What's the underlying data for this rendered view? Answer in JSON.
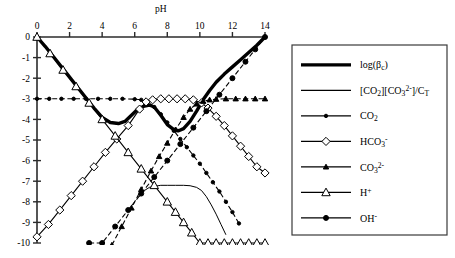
{
  "chart_data": {
    "type": "line",
    "title": "",
    "xlabel": "pH",
    "ylabel": "",
    "xlim": [
      0,
      14
    ],
    "ylim": [
      -10,
      0
    ],
    "xticks": [
      0,
      2,
      4,
      6,
      8,
      10,
      12,
      14
    ],
    "yticks": [
      0,
      -1,
      -2,
      -3,
      -4,
      -5,
      -6,
      -7,
      -8,
      -9,
      -10
    ],
    "xtick_labels": [
      "0",
      "2",
      "4",
      "6",
      "8",
      "10",
      "12",
      "14"
    ],
    "ytick_labels": [
      "0",
      "-1",
      "-2",
      "-3",
      "-4",
      "-5",
      "-6",
      "-7",
      "-8",
      "-9",
      "-10"
    ],
    "grid": false,
    "legend_position": "right",
    "series": [
      {
        "name": "log(βc)",
        "marker": "none",
        "linestyle": "solid-thick",
        "x": [
          0,
          0.5,
          1,
          1.5,
          2,
          2.5,
          3,
          3.5,
          4,
          4.5,
          5,
          5.4,
          5.8,
          6.2,
          6.6,
          6.9,
          7.2,
          7.6,
          8,
          8.4,
          8.7,
          9,
          9.4,
          9.8,
          10.2,
          10.6,
          11,
          11.5,
          12,
          12.5,
          13,
          13.5,
          14
        ],
        "y": [
          0,
          -0.45,
          -0.95,
          -1.45,
          -1.95,
          -2.45,
          -2.95,
          -3.45,
          -3.9,
          -4.15,
          -4.2,
          -4.1,
          -3.8,
          -3.5,
          -3.35,
          -3.3,
          -3.4,
          -3.8,
          -4.25,
          -4.5,
          -4.55,
          -4.45,
          -4.1,
          -3.6,
          -3.05,
          -2.6,
          -2.2,
          -1.8,
          -1.45,
          -1.1,
          -0.75,
          -0.4,
          0
        ]
      },
      {
        "name": "[CO2][CO3 2-]/CT",
        "marker": "none",
        "linestyle": "solid-thin",
        "x": [
          6.3,
          6.6,
          6.9,
          7.2,
          7.6,
          8,
          8.5,
          9,
          9.4,
          9.8,
          10.1,
          10.4,
          10.7,
          11,
          11.3,
          11.6
        ],
        "y": [
          -7.75,
          -7.45,
          -7.3,
          -7.25,
          -7.2,
          -7.2,
          -7.2,
          -7.2,
          -7.22,
          -7.3,
          -7.45,
          -7.75,
          -8.15,
          -8.6,
          -9.1,
          -9.6
        ]
      },
      {
        "name": "CO2",
        "marker": "small-filled-circle",
        "linestyle": "dash-dot",
        "x": [
          0,
          0.75,
          1.5,
          2.25,
          3,
          3.75,
          4.5,
          5.25,
          6,
          6.4,
          6.8,
          7.2,
          7.6,
          8,
          8.4,
          8.8,
          9.2,
          9.6,
          10,
          10.4,
          10.8,
          11.2,
          11.6,
          12,
          12.4
        ],
        "y": [
          -3.0,
          -3.0,
          -3.0,
          -3.0,
          -3.0,
          -3.0,
          -3.0,
          -3.0,
          -3.02,
          -3.05,
          -3.15,
          -3.4,
          -3.75,
          -4.15,
          -4.55,
          -4.95,
          -5.35,
          -5.75,
          -6.15,
          -6.6,
          -7.05,
          -7.5,
          -8.0,
          -8.5,
          -9.05
        ]
      },
      {
        "name": "HCO3-",
        "marker": "open-diamond",
        "linestyle": "solid",
        "x": [
          0,
          0.7,
          1.4,
          2.1,
          2.8,
          3.5,
          4.2,
          4.9,
          5.6,
          6.3,
          6.7,
          7.1,
          7.6,
          8.1,
          8.6,
          9.1,
          9.6,
          10.1,
          10.5,
          11,
          11.5,
          12,
          12.5,
          13,
          13.5,
          14
        ],
        "y": [
          -9.7,
          -9.1,
          -8.4,
          -7.7,
          -7.0,
          -6.3,
          -5.6,
          -4.95,
          -4.3,
          -3.5,
          -3.15,
          -3.05,
          -3.0,
          -3.0,
          -3.0,
          -3.0,
          -3.05,
          -3.2,
          -3.45,
          -3.85,
          -4.3,
          -4.8,
          -5.3,
          -5.8,
          -6.3,
          -6.6
        ]
      },
      {
        "name": "CO3 2-",
        "marker": "small-filled-triangle",
        "linestyle": "dash-dot",
        "x": [
          4.6,
          5.2,
          5.8,
          6.4,
          7,
          7.5,
          8,
          8.5,
          9,
          9.4,
          9.8,
          10.2,
          10.6,
          11,
          11.6,
          12.2,
          12.8,
          13.4,
          14
        ],
        "y": [
          -10.1,
          -9.2,
          -8.3,
          -7.4,
          -6.5,
          -5.8,
          -5.15,
          -4.5,
          -3.9,
          -3.5,
          -3.25,
          -3.12,
          -3.05,
          -3.02,
          -3.0,
          -3.0,
          -3.0,
          -3.0,
          -3.0
        ]
      },
      {
        "name": "H+",
        "marker": "open-triangle",
        "linestyle": "solid",
        "x": [
          0,
          0.8,
          1.6,
          2.4,
          3.2,
          4,
          4.8,
          5.6,
          6.4,
          7.2,
          8,
          8.5,
          9,
          9.5,
          10,
          10.5,
          11,
          11.5,
          12,
          12.5,
          13,
          13.5,
          14
        ],
        "y": [
          0,
          -0.8,
          -1.6,
          -2.4,
          -3.2,
          -4.0,
          -4.8,
          -5.6,
          -6.4,
          -7.2,
          -8.0,
          -8.5,
          -9.0,
          -9.5,
          -10,
          -10,
          -10,
          -10,
          -10,
          -10,
          -10,
          -10,
          -10
        ]
      },
      {
        "name": "OH-",
        "marker": "filled-circle",
        "linestyle": "dash-dot",
        "x": [
          3.2,
          4,
          4.8,
          5.6,
          6.4,
          7.2,
          8,
          8.8,
          9.6,
          10.4,
          11.2,
          12,
          12.8,
          13.4,
          14
        ],
        "y": [
          -10.0,
          -10.0,
          -9.2,
          -8.4,
          -7.6,
          -6.8,
          -6.0,
          -5.2,
          -4.4,
          -3.6,
          -2.8,
          -2.0,
          -1.2,
          -0.6,
          0
        ]
      }
    ]
  },
  "legend": {
    "entries": [
      {
        "label": "log(βc)",
        "style": "thick"
      },
      {
        "label": "[CO2][CO3 2-]/CT",
        "style": "thin"
      },
      {
        "label": "CO2",
        "style": "marker"
      },
      {
        "label": "HCO3-",
        "style": "marker"
      },
      {
        "label": "CO3 2-",
        "style": "marker"
      },
      {
        "label": "H+",
        "style": "marker"
      },
      {
        "label": "OH-",
        "style": "marker"
      }
    ]
  }
}
